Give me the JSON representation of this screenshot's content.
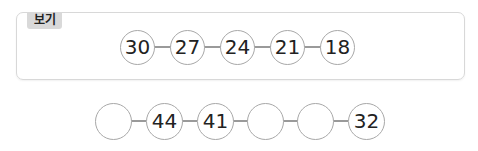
{
  "example": {
    "label": "보기",
    "values": [
      "30",
      "27",
      "24",
      "21",
      "18"
    ]
  },
  "problem": {
    "values": [
      "",
      "44",
      "41",
      "",
      "",
      "32"
    ]
  }
}
